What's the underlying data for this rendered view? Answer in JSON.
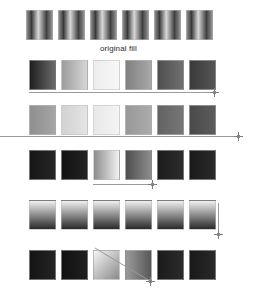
{
  "document": {
    "title": "gradient fill swatch comparison sheet",
    "background_color": "#ffffff",
    "width": 255,
    "height": 294
  },
  "captions": {
    "original_fill": "original fill"
  },
  "colors": {
    "guide_line": "#9a9a9a",
    "marker": "#7d7d7d",
    "swatch_border": "#bebebe",
    "caption_text": "#2b2b2b"
  },
  "rows": [
    {
      "id": "row-original-fill",
      "label": "original fill",
      "top": 10,
      "left": 26,
      "gradient_direction": "horizontal-symmetric",
      "swatches": [
        {
          "name": "swatch-1",
          "stops": [
            "#8a8a8a",
            "#3a3a3a",
            "#d8d8d8",
            "#3f3f3f",
            "#8f8f8f"
          ]
        },
        {
          "name": "swatch-2",
          "stops": [
            "#8a8a8a",
            "#3a3a3a",
            "#d8d8d8",
            "#3f3f3f",
            "#8f8f8f"
          ]
        },
        {
          "name": "swatch-3",
          "stops": [
            "#8a8a8a",
            "#3a3a3a",
            "#d8d8d8",
            "#3f3f3f",
            "#8f8f8f"
          ]
        },
        {
          "name": "swatch-4",
          "stops": [
            "#8a8a8a",
            "#3a3a3a",
            "#d8d8d8",
            "#3f3f3f",
            "#8f8f8f"
          ]
        },
        {
          "name": "swatch-5",
          "stops": [
            "#8a8a8a",
            "#3a3a3a",
            "#d8d8d8",
            "#3f3f3f",
            "#8f8f8f"
          ]
        },
        {
          "name": "swatch-6",
          "stops": [
            "#8a8a8a",
            "#3a3a3a",
            "#d8d8d8",
            "#3f3f3f",
            "#8f8f8f"
          ]
        }
      ],
      "guide": null
    },
    {
      "id": "row-horizontal-light-sweep",
      "label": "",
      "top": 60,
      "left": 29,
      "gradient_direction": "horizontal",
      "swatches": [
        {
          "name": "swatch-1",
          "stops": [
            "#1f1f1f",
            "#6a6a6a"
          ]
        },
        {
          "name": "swatch-2",
          "stops": [
            "#9c9c9c",
            "#d6d6d6"
          ]
        },
        {
          "name": "swatch-3",
          "stops": [
            "#ededed",
            "#f7f7f7"
          ]
        },
        {
          "name": "swatch-4",
          "stops": [
            "#808080",
            "#a8a8a8"
          ]
        },
        {
          "name": "swatch-5",
          "stops": [
            "#4f4f4f",
            "#707070"
          ]
        },
        {
          "name": "swatch-6",
          "stops": [
            "#3b3b3b",
            "#555555"
          ]
        }
      ],
      "guide": {
        "type": "horizontal-line",
        "left": 29,
        "top": 92,
        "width": 185,
        "marker_x": 210,
        "marker_y": 88
      }
    },
    {
      "id": "row-horizontal-mid-sweep",
      "top": 105,
      "left": 29,
      "gradient_direction": "horizontal",
      "swatches": [
        {
          "name": "swatch-1",
          "stops": [
            "#8f8f8f",
            "#a5a5a5"
          ]
        },
        {
          "name": "swatch-2",
          "stops": [
            "#d2d2d2",
            "#e4e4e4"
          ]
        },
        {
          "name": "swatch-3",
          "stops": [
            "#e8e8e8",
            "#f4f4f4"
          ]
        },
        {
          "name": "swatch-4",
          "stops": [
            "#989898",
            "#ababab"
          ]
        },
        {
          "name": "swatch-5",
          "stops": [
            "#636363",
            "#767676"
          ]
        },
        {
          "name": "swatch-6",
          "stops": [
            "#4a4a4a",
            "#5c5c5c"
          ]
        }
      ],
      "guide": {
        "type": "horizontal-line",
        "left": 0,
        "top": 136,
        "width": 238,
        "marker_x": 234,
        "marker_y": 132
      }
    },
    {
      "id": "row-dark-with-light-pair",
      "top": 150,
      "left": 29,
      "gradient_direction": "horizontal",
      "swatches": [
        {
          "name": "swatch-1",
          "stops": [
            "#161616",
            "#262626"
          ]
        },
        {
          "name": "swatch-2",
          "stops": [
            "#131313",
            "#222222"
          ]
        },
        {
          "name": "swatch-3",
          "stops": [
            "#8c8c8c",
            "#f2f2f2"
          ]
        },
        {
          "name": "swatch-4",
          "stops": [
            "#4e4e4e",
            "#8d8d8d"
          ]
        },
        {
          "name": "swatch-5",
          "stops": [
            "#1c1c1c",
            "#2c2c2c"
          ]
        },
        {
          "name": "swatch-6",
          "stops": [
            "#1a1a1a",
            "#2a2a2a"
          ]
        }
      ],
      "guide": {
        "type": "horizontal-line",
        "left": 93,
        "top": 184,
        "width": 60,
        "marker_x": 148,
        "marker_y": 180
      }
    },
    {
      "id": "row-vertical-sweep",
      "top": 200,
      "left": 29,
      "gradient_direction": "vertical",
      "swatches": [
        {
          "name": "swatch-1",
          "stops": [
            "#f0f0f0",
            "#909090",
            "#2a2a2a"
          ]
        },
        {
          "name": "swatch-2",
          "stops": [
            "#f0f0f0",
            "#909090",
            "#2a2a2a"
          ]
        },
        {
          "name": "swatch-3",
          "stops": [
            "#f0f0f0",
            "#909090",
            "#2a2a2a"
          ]
        },
        {
          "name": "swatch-4",
          "stops": [
            "#f0f0f0",
            "#909090",
            "#2a2a2a"
          ]
        },
        {
          "name": "swatch-5",
          "stops": [
            "#f0f0f0",
            "#909090",
            "#2a2a2a"
          ]
        },
        {
          "name": "swatch-6",
          "stops": [
            "#f0f0f0",
            "#909090",
            "#2a2a2a"
          ]
        }
      ],
      "guide": {
        "type": "vertical-line",
        "left": 218,
        "top": 203,
        "height": 30,
        "marker_x": 214,
        "marker_y": 230
      }
    },
    {
      "id": "row-diagonal-sweep",
      "top": 250,
      "left": 29,
      "gradient_direction": "diagonal",
      "swatches": [
        {
          "name": "swatch-1",
          "stops": [
            "#141414",
            "#242424"
          ]
        },
        {
          "name": "swatch-2",
          "stops": [
            "#111111",
            "#202020"
          ]
        },
        {
          "name": "swatch-3",
          "stops": [
            "#8a8a8a",
            "#f4f4f4"
          ]
        },
        {
          "name": "swatch-4",
          "stops": [
            "#585858",
            "#9a9a9a"
          ]
        },
        {
          "name": "swatch-5",
          "stops": [
            "#1b1b1b",
            "#2b2b2b"
          ]
        },
        {
          "name": "swatch-6",
          "stops": [
            "#191919",
            "#292929"
          ]
        }
      ],
      "guide": {
        "type": "diagonal-line",
        "x1": 95,
        "y1": 248,
        "x2": 150,
        "y2": 281,
        "marker_x": 146,
        "marker_y": 278
      }
    }
  ]
}
